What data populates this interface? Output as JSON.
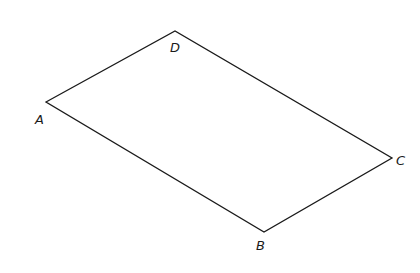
{
  "figure": {
    "type": "parallelogram",
    "stroke_color": "#1a1a1a",
    "background": "#ffffff",
    "vertices": [
      {
        "id": "A",
        "label": "A",
        "x": 46,
        "y": 102,
        "lx": 35,
        "ly": 124
      },
      {
        "id": "D",
        "label": "D",
        "x": 175,
        "y": 31,
        "lx": 170,
        "ly": 52
      },
      {
        "id": "C",
        "label": "C",
        "x": 392,
        "y": 158,
        "lx": 396,
        "ly": 165
      },
      {
        "id": "B",
        "label": "B",
        "x": 264,
        "y": 232,
        "lx": 256,
        "ly": 250
      }
    ],
    "edges": [
      [
        "A",
        "D"
      ],
      [
        "D",
        "C"
      ],
      [
        "C",
        "B"
      ],
      [
        "B",
        "A"
      ]
    ]
  }
}
